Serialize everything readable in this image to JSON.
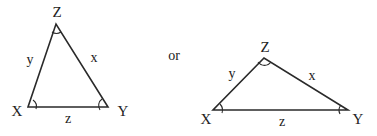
{
  "diagram": {
    "connector_text": "or",
    "triangles": [
      {
        "id": "left",
        "vertices": {
          "X": {
            "label": "X",
            "pos": [
              28,
              107
            ],
            "label_pos": [
              17,
              116
            ]
          },
          "Y": {
            "label": "Y",
            "pos": [
              108,
              107
            ],
            "label_pos": [
              123,
              116
            ]
          },
          "Z": {
            "label": "Z",
            "pos": [
              56,
              24
            ],
            "label_pos": [
              57,
              17
            ]
          }
        },
        "sides": {
          "x": {
            "label": "x",
            "between": [
              "Z",
              "Y"
            ],
            "label_pos": [
              94,
              62
            ]
          },
          "y": {
            "label": "y",
            "between": [
              "X",
              "Z"
            ],
            "label_pos": [
              30,
              64
            ]
          },
          "z": {
            "label": "z",
            "between": [
              "X",
              "Y"
            ],
            "label_pos": [
              68,
              123
            ]
          }
        }
      },
      {
        "id": "right",
        "vertices": {
          "X": {
            "label": "X",
            "pos": [
              213,
              110
            ],
            "label_pos": [
              206,
              124
            ]
          },
          "Y": {
            "label": "Y",
            "pos": [
              348,
              110
            ],
            "label_pos": [
              358,
              124
            ]
          },
          "Z": {
            "label": "Z",
            "pos": [
              264,
              58
            ],
            "label_pos": [
              265,
              52
            ]
          }
        },
        "sides": {
          "x": {
            "label": "x",
            "between": [
              "Z",
              "Y"
            ],
            "label_pos": [
              312,
              80
            ]
          },
          "y": {
            "label": "y",
            "between": [
              "X",
              "Z"
            ],
            "label_pos": [
              232,
              78
            ]
          },
          "z": {
            "label": "z",
            "between": [
              "X",
              "Y"
            ],
            "label_pos": [
              282,
              126
            ]
          }
        }
      }
    ]
  }
}
